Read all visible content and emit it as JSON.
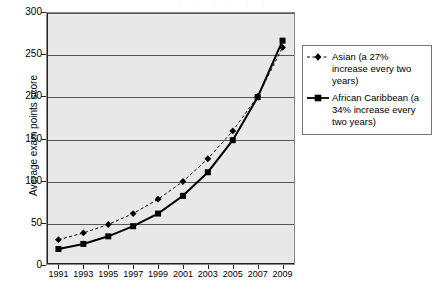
{
  "chart_data": {
    "type": "line",
    "title": "",
    "xlabel": "",
    "ylabel": "Average exam points score",
    "categories": [
      "1991",
      "1993",
      "1995",
      "1997",
      "1999",
      "2001",
      "2003",
      "2005",
      "2007",
      "2009"
    ],
    "ylim": [
      0,
      300
    ],
    "yticks": [
      "0",
      "50",
      "100",
      "150",
      "200",
      "250",
      "300"
    ],
    "ytick_values": [
      0,
      50,
      100,
      150,
      200,
      250,
      300
    ],
    "grid": true,
    "legend_position": "right",
    "series": [
      {
        "name": "Asian (a 27% increase every two years)",
        "short_name": "Asian",
        "marker": "diamond",
        "linestyle": "dashed",
        "color": "#000000",
        "values": [
          30,
          38,
          48,
          61,
          78,
          99,
          126,
          159,
          200,
          258
        ]
      },
      {
        "name": "African Caribbean (a 34% increase every two years)",
        "short_name": "African Caribbean",
        "marker": "square",
        "linestyle": "solid",
        "color": "#000000",
        "values": [
          19,
          25,
          34,
          46,
          61,
          82,
          110,
          148,
          199,
          266
        ]
      }
    ]
  },
  "legend": {
    "entries": [
      {
        "line1": "Asian (a 27% increase",
        "line2": "every two years)",
        "line3": ""
      },
      {
        "line1": "African Caribbean",
        "line2": "(a 34% increase every",
        "line3": "two years)"
      }
    ]
  },
  "artifact": {
    "top_strip": ". , . , . ,"
  },
  "colors": {
    "plot_background": "#e8e8e8",
    "gridline": "#555555",
    "axis": "#222222",
    "series": "#000000",
    "legend_border": "#777777",
    "page_background": "#ffffff"
  }
}
